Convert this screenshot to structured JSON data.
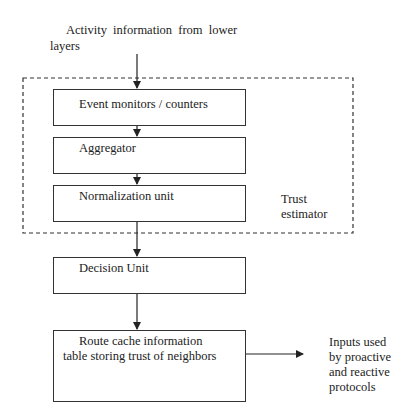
{
  "diagram": {
    "input_label_line1": "Activity information from lower",
    "input_label_line2": "layers",
    "trust_estimator_label_line1": "Trust",
    "trust_estimator_label_line2": "estimator",
    "boxes": [
      {
        "id": "event-monitors",
        "label": "Event monitors / counters"
      },
      {
        "id": "aggregator",
        "label": "Aggregator"
      },
      {
        "id": "normalization",
        "label": "Normalization unit"
      },
      {
        "id": "decision",
        "label": "Decision Unit"
      },
      {
        "id": "route-cache",
        "label_line1": "Route cache information",
        "label_line2": "table storing trust of neighbors"
      }
    ],
    "output_label": [
      "Inputs used",
      "by proactive",
      "and reactive",
      "protocols"
    ],
    "edges": [
      {
        "from": "lower-layers",
        "to": "event-monitors"
      },
      {
        "from": "event-monitors",
        "to": "aggregator"
      },
      {
        "from": "aggregator",
        "to": "normalization"
      },
      {
        "from": "normalization",
        "to": "decision"
      },
      {
        "from": "decision",
        "to": "route-cache"
      },
      {
        "from": "route-cache",
        "to": "outputs"
      }
    ],
    "group": {
      "name": "trust-estimator",
      "style": "dashed",
      "contains": [
        "event-monitors",
        "aggregator",
        "normalization"
      ]
    }
  }
}
